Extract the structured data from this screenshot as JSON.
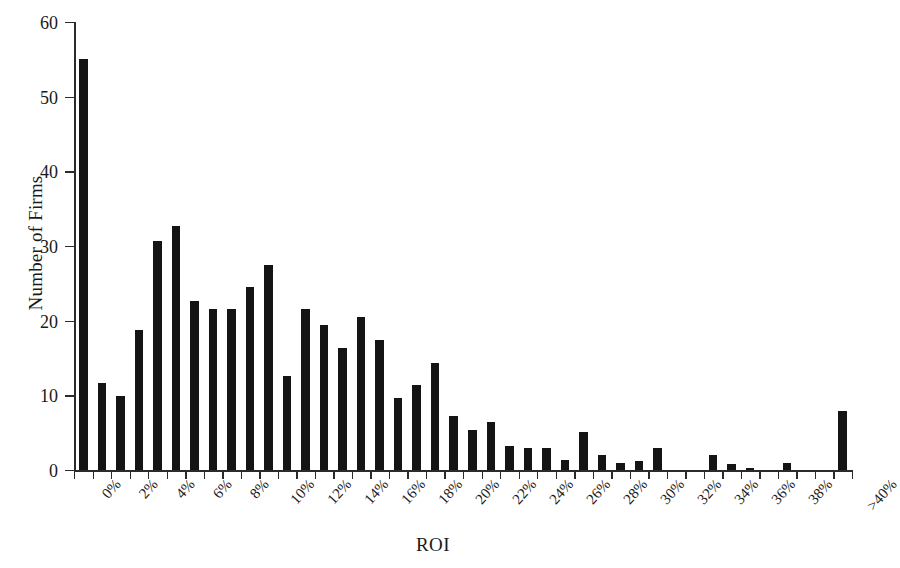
{
  "chart_data": {
    "type": "bar",
    "title": "",
    "xlabel": "ROI",
    "ylabel": "Number of Firms",
    "ylim": [
      0,
      60
    ],
    "yticks": [
      0,
      10,
      20,
      30,
      40,
      50,
      60
    ],
    "grid": false,
    "legend": null,
    "categories": [
      "0%",
      "1%",
      "2%",
      "3%",
      "4%",
      "5%",
      "6%",
      "7%",
      "8%",
      "9%",
      "10%",
      "11%",
      "12%",
      "13%",
      "14%",
      "15%",
      "16%",
      "17%",
      "18%",
      "19%",
      "20%",
      "21%",
      "22%",
      "23%",
      "24%",
      "25%",
      "26%",
      "27%",
      "28%",
      "29%",
      "30%",
      "31%",
      "32%",
      "33%",
      "34%",
      "35%",
      "36%",
      "37%",
      "38%",
      "39%",
      "40%",
      ">40%"
    ],
    "tick_labels": [
      "0%",
      "",
      "2%",
      "",
      "4%",
      "",
      "6%",
      "",
      "8%",
      "",
      "10%",
      "",
      "12%",
      "",
      "14%",
      "",
      "16%",
      "",
      "18%",
      "",
      "20%",
      "",
      "22%",
      "",
      "24%",
      "",
      "26%",
      "",
      "28%",
      "",
      "30%",
      "",
      "32%",
      "",
      "34%",
      "",
      "36%",
      "",
      "38%",
      "",
      "",
      ">40%"
    ],
    "values": [
      55,
      11.7,
      9.9,
      18.8,
      30.7,
      32.7,
      22.6,
      21.6,
      21.5,
      24.5,
      27.5,
      12.6,
      21.6,
      19.4,
      16.4,
      20.5,
      17.4,
      9.6,
      11.4,
      14.3,
      7.3,
      5.4,
      6.4,
      3.2,
      3.0,
      2.9,
      1.3,
      5.1,
      2.0,
      1.0,
      1.2,
      3.0,
      0.0,
      0.0,
      2.0,
      0.8,
      0.3,
      0.0,
      1.0,
      0.0,
      0.0,
      7.9
    ],
    "bar_color": "#141414",
    "axis_color": "#2b2b2b",
    "background": "#ffffff"
  },
  "axes": {
    "y_title": "Number of Firms",
    "x_title": "ROI"
  }
}
